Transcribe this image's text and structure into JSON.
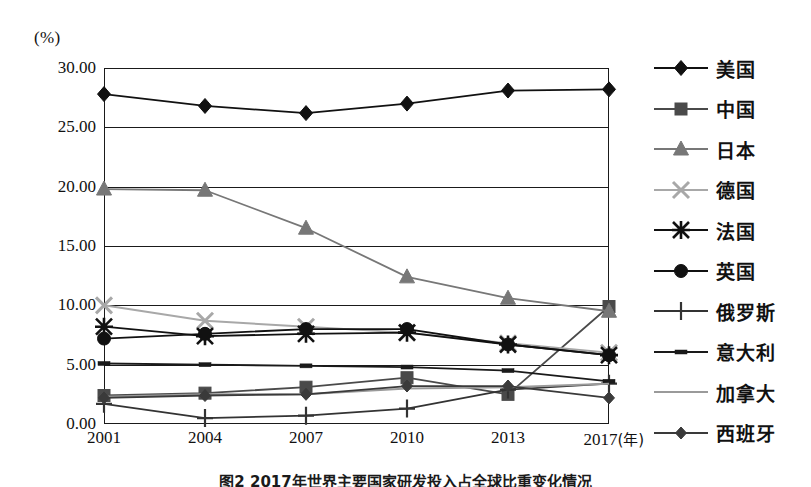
{
  "axis": {
    "unit_label": "(%)",
    "x_unit": "(年)",
    "y_ticks": [
      "30.00",
      "25.00",
      "20.00",
      "15.00",
      "10.00",
      "5.00",
      "0.00"
    ],
    "x_ticks": [
      "2001",
      "2004",
      "2007",
      "2010",
      "2013",
      "2017"
    ]
  },
  "caption": "图2  2017年世界主要国家研发投入占全球比重变化情况",
  "legend": {
    "items": [
      {
        "label": "美国",
        "marker": "diamond",
        "color": "#111111"
      },
      {
        "label": "中国",
        "marker": "square",
        "color": "#4a4a4a"
      },
      {
        "label": "日本",
        "marker": "triangle",
        "color": "#777777"
      },
      {
        "label": "德国",
        "marker": "cross-x",
        "color": "#a8a8a8"
      },
      {
        "label": "法国",
        "marker": "asterisk",
        "color": "#111111"
      },
      {
        "label": "英国",
        "marker": "circle",
        "color": "#111111"
      },
      {
        "label": "俄罗斯",
        "marker": "plus",
        "color": "#333333"
      },
      {
        "label": "意大利",
        "marker": "dash",
        "color": "#1a1a1a"
      },
      {
        "label": "加拿大",
        "marker": "line-only",
        "color": "#9a9a9a"
      },
      {
        "label": "西班牙",
        "marker": "diamond-small",
        "color": "#3a3a3a"
      }
    ]
  },
  "chart_data": {
    "type": "line",
    "title": "图2  2017年世界主要国家研发投入占全球比重变化情况",
    "xlabel": "(年)",
    "ylabel": "(%)",
    "xlim": [
      2001,
      2017
    ],
    "ylim": [
      0,
      30
    ],
    "ytick_values": [
      0,
      5,
      10,
      15,
      20,
      25,
      30
    ],
    "grid": true,
    "legend_position": "right",
    "categories": [
      "2001",
      "2004",
      "2007",
      "2010",
      "2013",
      "2017"
    ],
    "series": [
      {
        "name": "美国",
        "marker": "diamond",
        "color": "#111111",
        "values": [
          27.8,
          26.8,
          26.2,
          27.0,
          28.1,
          28.2
        ]
      },
      {
        "name": "中国",
        "marker": "square",
        "color": "#4a4a4a",
        "values": [
          2.4,
          2.6,
          3.1,
          3.9,
          2.5,
          9.9
        ]
      },
      {
        "name": "日本",
        "marker": "triangle",
        "color": "#777777",
        "values": [
          19.8,
          19.7,
          16.5,
          12.4,
          10.6,
          9.5
        ]
      },
      {
        "name": "德国",
        "marker": "cross-x",
        "color": "#a8a8a8",
        "values": [
          10.0,
          8.7,
          8.2,
          7.7,
          6.8,
          6.0
        ]
      },
      {
        "name": "法国",
        "marker": "asterisk",
        "color": "#111111",
        "values": [
          8.2,
          7.4,
          7.6,
          7.7,
          6.7,
          5.8
        ]
      },
      {
        "name": "英国",
        "marker": "circle",
        "color": "#111111",
        "values": [
          7.2,
          7.6,
          8.0,
          8.0,
          6.7,
          5.8
        ]
      },
      {
        "name": "俄罗斯",
        "marker": "plus",
        "color": "#333333",
        "values": [
          1.7,
          0.5,
          0.7,
          1.3,
          2.9,
          3.4
        ]
      },
      {
        "name": "意大利",
        "marker": "dash",
        "color": "#1a1a1a",
        "values": [
          5.1,
          5.0,
          4.9,
          4.8,
          4.5,
          3.6
        ]
      },
      {
        "name": "加拿大",
        "marker": "line-only",
        "color": "#9a9a9a",
        "values": [
          2.3,
          2.5,
          2.5,
          3.0,
          3.1,
          3.4
        ]
      },
      {
        "name": "西班牙",
        "marker": "diamond-small",
        "color": "#3a3a3a",
        "values": [
          2.2,
          2.4,
          2.5,
          3.2,
          3.2,
          2.2
        ]
      }
    ]
  }
}
